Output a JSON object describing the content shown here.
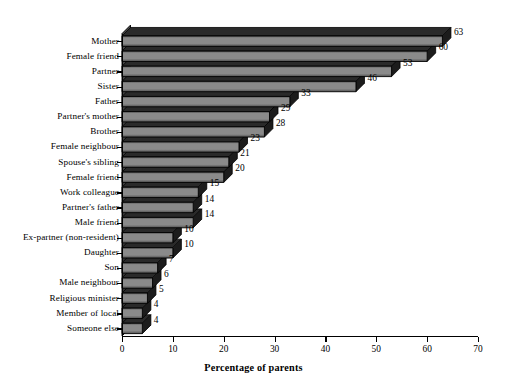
{
  "chart_data": {
    "type": "bar",
    "orientation": "horizontal",
    "title": "",
    "subtitle": "",
    "xlabel": "Percentage of parents",
    "ylabel": "",
    "xlim": [
      0,
      70
    ],
    "xticks": [
      0,
      10,
      20,
      30,
      40,
      50,
      60,
      70
    ],
    "xtick_labels": [
      "0",
      "10",
      "20",
      "30",
      "40",
      "50",
      "60",
      "70"
    ],
    "grid": false,
    "legend": null,
    "style": "3d-bar",
    "categories": [
      "Mother",
      "Female friend",
      "Partner",
      "Sister",
      "Father",
      "Partner's mother",
      "Brother",
      "Female neighbour",
      "Spouse's sibling",
      "Female friend",
      "Work colleague",
      "Partner's father",
      "Male friend",
      "Ex-partner (non-resident)",
      "Daughter",
      "Son",
      "Male neighbour",
      "Religious minister",
      "Member of local",
      "Someone else"
    ],
    "values": [
      63,
      60,
      53,
      46,
      33,
      29,
      28,
      23,
      21,
      20,
      15,
      14,
      14,
      10,
      10,
      7,
      6,
      5,
      4,
      4
    ],
    "data_labels": [
      "63",
      "60",
      "53",
      "46",
      "33",
      "29",
      "28",
      "23",
      "21",
      "20",
      "15",
      "14",
      "14",
      "10",
      "10",
      "7",
      "6",
      "5",
      "4",
      "4"
    ],
    "colors": {
      "bar_face_light": "#8a8a8a",
      "bar_face_dark": "#4f4f4f",
      "bar_edge": "#000000",
      "bar_side": "#1c1c1c",
      "bar_top": "#2a2a2a",
      "wall": "#3a3a3a",
      "axis": "#000000",
      "background": "#ffffff",
      "text": "#000000"
    }
  }
}
